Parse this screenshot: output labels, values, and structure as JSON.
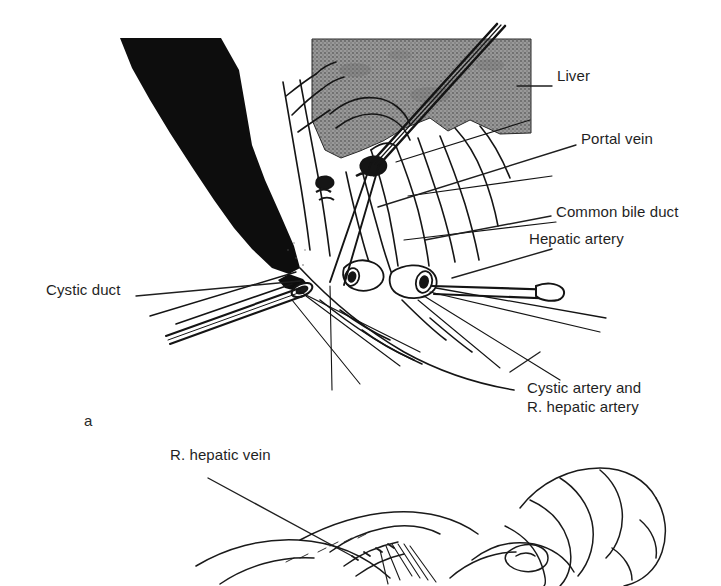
{
  "figure": {
    "type": "surgical-line-illustration",
    "panels": [
      {
        "id": "a",
        "letter": "a",
        "description": "Hepatic hilum dissection with liver retracted, showing cystic duct, common bile duct, portal vein, hepatic artery and cystic artery"
      },
      {
        "id": "b",
        "letter": "",
        "description": "Hand-held liver mobilization showing right hepatic vein"
      }
    ],
    "labels": [
      {
        "id": "liver",
        "text": "Liver",
        "x": 557,
        "y": 75,
        "align": "left"
      },
      {
        "id": "portal-vein",
        "text": "Portal vein",
        "x": 581,
        "y": 138,
        "align": "left"
      },
      {
        "id": "common-bile-duct",
        "text": "Common bile duct",
        "x": 556,
        "y": 211,
        "align": "left"
      },
      {
        "id": "hepatic-artery",
        "text": "Hepatic artery",
        "x": 529,
        "y": 238,
        "align": "left"
      },
      {
        "id": "cystic-duct",
        "text": "Cystic duct",
        "x": 46,
        "y": 289,
        "align": "left"
      },
      {
        "id": "cystic-artery-line1",
        "text": "Cystic artery and",
        "x": 527,
        "y": 387,
        "align": "left"
      },
      {
        "id": "cystic-artery-line2",
        "text": "R. hepatic artery",
        "x": 527,
        "y": 406,
        "align": "left"
      },
      {
        "id": "r-hepatic-vein",
        "text": "R. hepatic vein",
        "x": 170,
        "y": 454,
        "align": "left"
      }
    ],
    "panel_letters": [
      {
        "id": "panel-a-letter",
        "text": "a",
        "x": 84,
        "y": 412
      }
    ],
    "colors": {
      "ink": "#1a1a1a",
      "liver_fill": "#8a8a8a",
      "retractor_fill": "#0d0d0d",
      "page_background": "#ffffff",
      "text": "#1f1f1f"
    }
  }
}
